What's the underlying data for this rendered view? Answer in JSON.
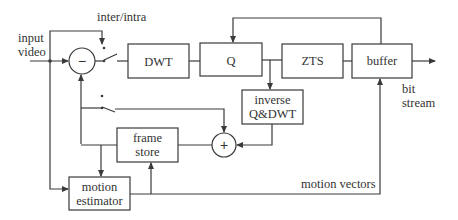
{
  "diagram": {
    "inputs": {
      "input_video": [
        "input",
        "video"
      ]
    },
    "labels": {
      "inter_intra": "inter/intra",
      "bit_stream": [
        "bit",
        "stream"
      ],
      "motion_vectors": "motion vectors"
    },
    "blocks": {
      "dwt": "DWT",
      "q": "Q",
      "zts": "ZTS",
      "buffer": "buffer",
      "inverse_qdwt": [
        "inverse",
        "Q&DWT"
      ],
      "frame_store": [
        "frame",
        "store"
      ],
      "motion_estimator": [
        "motion",
        "estimator"
      ]
    },
    "operators": {
      "subtractor": "−",
      "adder": "+"
    },
    "colors": {
      "line": "#3a3a3a",
      "text": "#333333",
      "background": "#ffffff"
    }
  }
}
